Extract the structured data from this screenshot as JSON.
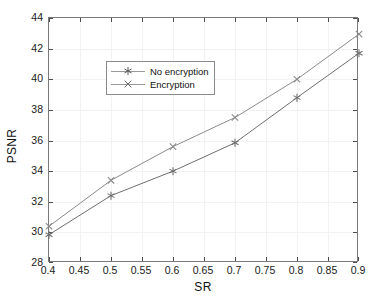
{
  "chart_data": {
    "type": "line",
    "title": "",
    "xlabel": "SR",
    "ylabel": "PSNR",
    "xlim": [
      0.4,
      0.9
    ],
    "ylim": [
      28,
      44
    ],
    "grid": true,
    "legend_position": "upper left",
    "x": [
      0.4,
      0.5,
      0.6,
      0.7,
      0.8,
      0.9
    ],
    "xticks": [
      "0.4",
      "0.45",
      "0.5",
      "0.55",
      "0.6",
      "0.65",
      "0.7",
      "0.75",
      "0.8",
      "0.85",
      "0.9"
    ],
    "xtick_values": [
      0.4,
      0.45,
      0.5,
      0.55,
      0.6,
      0.65,
      0.7,
      0.75,
      0.8,
      0.85,
      0.9
    ],
    "yticks": [
      "28",
      "30",
      "32",
      "34",
      "36",
      "38",
      "40",
      "42",
      "44"
    ],
    "ytick_values": [
      28,
      30,
      32,
      34,
      36,
      38,
      40,
      42,
      44
    ],
    "series": [
      {
        "name": "No encryption",
        "marker": "asterisk",
        "color": "#6e6e6e",
        "values": [
          29.85,
          32.4,
          34.0,
          35.85,
          38.8,
          41.7
        ]
      },
      {
        "name": "Encryption",
        "marker": "cross",
        "color": "#8a8a8a",
        "values": [
          30.4,
          33.4,
          35.6,
          37.5,
          40.0,
          42.95
        ]
      }
    ]
  },
  "legend": {
    "entries": [
      {
        "label": "No encryption",
        "marker": "asterisk"
      },
      {
        "label": "Encryption",
        "marker": "cross"
      }
    ]
  },
  "axes": {
    "xlabel": "SR",
    "ylabel": "PSNR"
  },
  "colors": {
    "axis": "#7a7a7a",
    "grid": "#f2f2f2",
    "text": "#111111",
    "series_a": "#6e6e6e",
    "series_b": "#8a8a8a",
    "background": "#ffffff"
  }
}
